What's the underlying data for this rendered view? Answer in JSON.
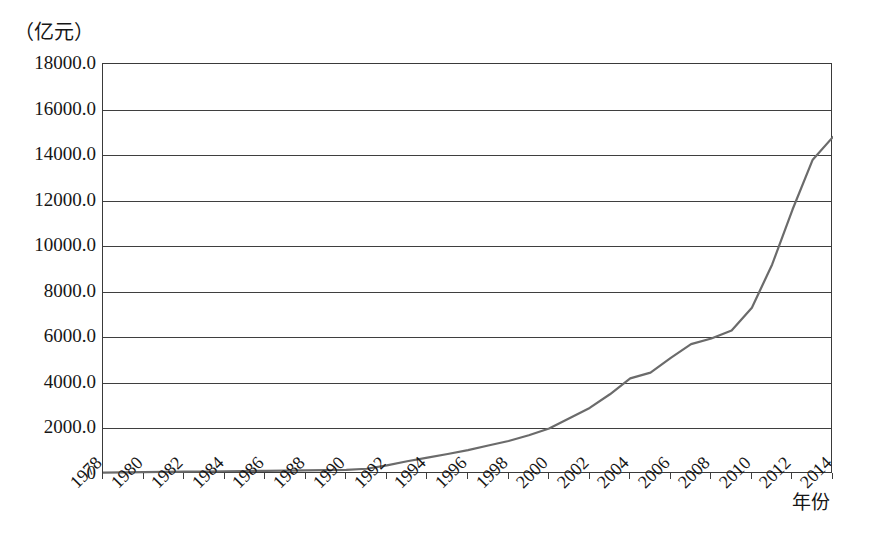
{
  "axis": {
    "y_unit_label": "（亿元）",
    "x_axis_title": "年份",
    "y_ticks": [
      "18000.0",
      "16000.0",
      "14000.0",
      "12000.0",
      "10000.0",
      "8000.0",
      "6000.0",
      "4000.0",
      "2000.0",
      "0"
    ],
    "x_ticks": [
      "1978",
      "1980",
      "1982",
      "1984",
      "1986",
      "1988",
      "1990",
      "1992",
      "1994",
      "1996",
      "1998",
      "2000",
      "2002",
      "2004",
      "2006",
      "2008",
      "2010",
      "2012",
      "2014"
    ]
  },
  "style": {
    "line_color": "#6b6b6b",
    "grid_color": "#3f3f3f",
    "frame_color": "#3a3a3a",
    "text_color": "#161616",
    "background": "#ffffff"
  },
  "chart_data": {
    "type": "line",
    "title": "",
    "subtitle": "",
    "xlabel": "年份",
    "ylabel": "（亿元）",
    "ylim": [
      0,
      18000
    ],
    "xlim": [
      1978,
      2014
    ],
    "ytick_step": 2000,
    "grid": "horizontal",
    "legend": "none",
    "x": [
      1978,
      1979,
      1980,
      1981,
      1982,
      1983,
      1984,
      1985,
      1986,
      1987,
      1988,
      1989,
      1990,
      1991,
      1992,
      1993,
      1994,
      1995,
      1996,
      1997,
      1998,
      1999,
      2000,
      2001,
      2002,
      2003,
      2004,
      2005,
      2006,
      2007,
      2008,
      2009,
      2010,
      2011,
      2012,
      2013,
      2014
    ],
    "series": [
      {
        "name": "研究与试验发展经费支出",
        "values": [
          52,
          58,
          62,
          66,
          70,
          78,
          88,
          102,
          112,
          122,
          130,
          140,
          150,
          165,
          200,
          290,
          370,
          450,
          520,
          600,
          680,
          780,
          896,
          1042,
          1288,
          1540,
          1966,
          2450,
          3003,
          3710,
          4616,
          5802,
          7063,
          8687,
          10298,
          11847,
          13312
        ]
      }
    ],
    "note": "Values in 亿元 (100 million CNY)."
  },
  "series_points": {
    "comment": "Rendered polyline values matching the drawn curve (亿元).",
    "years": [
      1978,
      1979,
      1980,
      1981,
      1982,
      1983,
      1984,
      1985,
      1986,
      1987,
      1988,
      1989,
      1990,
      1991,
      1992,
      1993,
      1994,
      1995,
      1996,
      1997,
      1998,
      1999,
      2000,
      2001,
      2002,
      2003,
      2004,
      2005,
      2006,
      2007,
      2008,
      2009,
      2010,
      2011,
      2012,
      2013,
      2014
    ],
    "values": [
      60,
      70,
      80,
      90,
      100,
      110,
      120,
      130,
      140,
      150,
      160,
      170,
      185,
      230,
      380,
      560,
      720,
      880,
      1050,
      1250,
      1450,
      1700,
      2000,
      2450,
      2900,
      3500,
      4200,
      4450,
      5100,
      5700,
      5950,
      6300,
      7300,
      9200,
      11600,
      13800,
      14800
    ]
  }
}
